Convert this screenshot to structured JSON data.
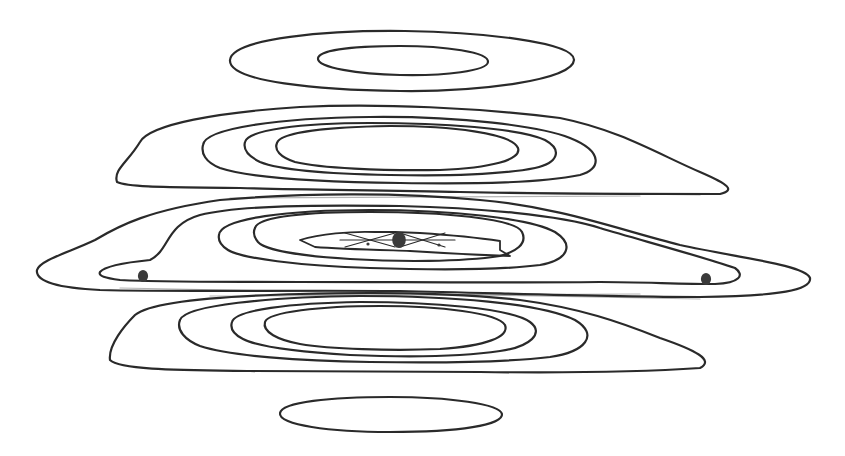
{
  "diagram": {
    "kind": "contour-plot",
    "background": "#ffffff",
    "stroke_color": "#2a2a2a",
    "stroke_width": 2.2,
    "marker_color": "#3a3a3a",
    "lobes": [
      {
        "name": "top-small-lobe",
        "contours": [
          "M 230 60 C 232 38, 330 30, 405 31 C 480 32, 575 42, 574 60 C 573 80, 480 92, 400 91 C 320 90, 228 82, 230 60 Z",
          "M 318 58 C 320 49, 360 46, 400 46 C 445 46, 489 52, 488 62 C 487 71, 445 76, 400 75 C 360 74, 316 68, 318 58 Z"
        ]
      },
      {
        "name": "upper-lobe",
        "contours": [
          "M 117 182 C 113 170, 128 162, 140 142 C 150 124, 220 112, 300 107 C 380 103, 480 108, 560 118 C 620 130, 660 155, 700 172 C 730 185, 735 190, 720 194 C 640 194, 540 194, 460 192 C 380 190, 300 190, 240 188 C 180 187, 130 188, 117 182 Z",
          "M 203 145 C 205 128, 280 118, 370 117 C 460 116, 540 126, 570 138 C 605 152, 600 170, 580 175 C 540 183, 480 184, 400 183 C 320 182, 250 178, 220 168 C 205 162, 201 153, 203 145 Z",
          "M 245 142 C 248 130, 300 123, 370 123 C 440 123, 520 128, 545 140 C 563 150, 558 163, 535 168 C 500 175, 440 176, 390 175 C 330 174, 280 170, 260 162 C 248 156, 243 149, 245 142 Z",
          "M 277 143 C 280 132, 330 127, 390 126 C 450 126, 512 133, 518 148 C 522 160, 490 168, 440 170 C 380 171, 320 168, 295 162 C 280 157, 274 150, 277 143 Z"
        ]
      },
      {
        "name": "middle-lobe",
        "contours": [
          "M 37 270 C 40 260, 70 252, 95 240 C 120 225, 150 210, 220 200 C 300 193, 400 192, 480 200 C 560 207, 620 230, 680 245 C 740 258, 805 265, 810 278 C 812 290, 780 296, 700 297 C 600 297, 500 293, 400 291 C 300 290, 180 292, 100 290 C 60 288, 35 282, 37 270 Z",
          "M 100 272 C 105 266, 130 262, 150 260 C 170 250, 165 225, 200 215 C 240 205, 320 205, 400 206 C 480 208, 560 215, 600 228 C 640 240, 700 256, 735 268 C 745 275, 740 283, 715 284 C 680 284, 640 282, 600 282 C 500 283, 400 282, 300 282 C 220 282, 160 282, 120 280 C 105 278, 98 276, 100 272 Z",
          "M 219 235 C 220 218, 290 210, 370 210 C 450 210, 530 218, 555 232 C 575 245, 568 260, 540 265 C 500 270, 430 270, 370 268 C 300 266, 240 258, 228 250 C 220 245, 218 240, 219 235 Z",
          "M 255 228 C 258 216, 310 212, 370 212 C 440 212, 515 218, 522 232 C 528 244, 515 252, 500 256 C 460 262, 400 262, 350 259 C 300 256, 265 250, 258 242 C 254 237, 253 232, 255 228 Z"
        ]
      },
      {
        "name": "lower-lobe",
        "contours": [
          "M 110 360 C 108 345, 125 325, 135 315 C 150 302, 220 296, 300 294 C 380 292, 460 293, 520 300 C 580 308, 620 322, 660 338 C 695 350, 715 360, 700 368 C 640 372, 560 373, 480 372 C 400 371, 320 372, 250 371 C 180 370, 120 370, 110 360 Z",
          "M 180 320 C 185 305, 270 297, 360 296 C 450 296, 540 303, 575 320 C 600 335, 585 352, 550 357 C 500 363, 430 363, 370 362 C 300 361, 230 356, 200 346 C 185 340, 176 330, 180 320 Z",
          "M 232 322 C 235 310, 290 303, 360 302 C 430 302, 510 308, 530 322 C 545 333, 530 347, 500 351 C 460 357, 400 357, 350 355 C 300 352, 258 347, 243 339 C 233 334, 230 328, 232 322 Z",
          "M 265 322 C 268 312, 320 306, 380 306 C 440 306, 498 313, 505 325 C 510 337, 485 346, 440 349 C 390 351, 330 349, 300 344 C 278 340, 262 332, 265 322 Z"
        ]
      },
      {
        "name": "bottom-small-lobe",
        "contours": [
          "M 280 413 C 282 402, 330 397, 390 397 C 450 397, 500 404, 502 414 C 503 425, 460 432, 390 432 C 330 432, 278 425, 280 413 Z"
        ]
      }
    ],
    "center_kite": {
      "outer": "M 300 240 C 320 234, 350 231, 375 232 L 395 232 L 420 233 C 450 235, 480 238, 500 241 L 500 250 L 510 256 C 480 255, 440 253, 410 251 C 380 250, 340 249, 315 247 Z",
      "inner_x_lines": [
        "M 345 233 L 395 247",
        "M 395 233 L 345 247",
        "M 400 233 L 445 247",
        "M 445 233 L 400 247",
        "M 340 240 L 455 240"
      ]
    },
    "markers": [
      {
        "name": "center-marker",
        "cx": 399,
        "cy": 240,
        "r": 8
      },
      {
        "name": "left-marker",
        "cx": 143,
        "cy": 276,
        "r": 6
      },
      {
        "name": "right-marker",
        "cx": 706,
        "cy": 279,
        "r": 6
      }
    ],
    "small_dots": [
      {
        "cx": 368,
        "cy": 244,
        "r": 1.6
      },
      {
        "cx": 439,
        "cy": 245,
        "r": 1.6
      }
    ],
    "gap_bands": [
      "M 150 187 L 700 195",
      "M 230 198 L 640 196",
      "M 120 288 L 700 299",
      "M 210 296 L 640 294"
    ]
  }
}
